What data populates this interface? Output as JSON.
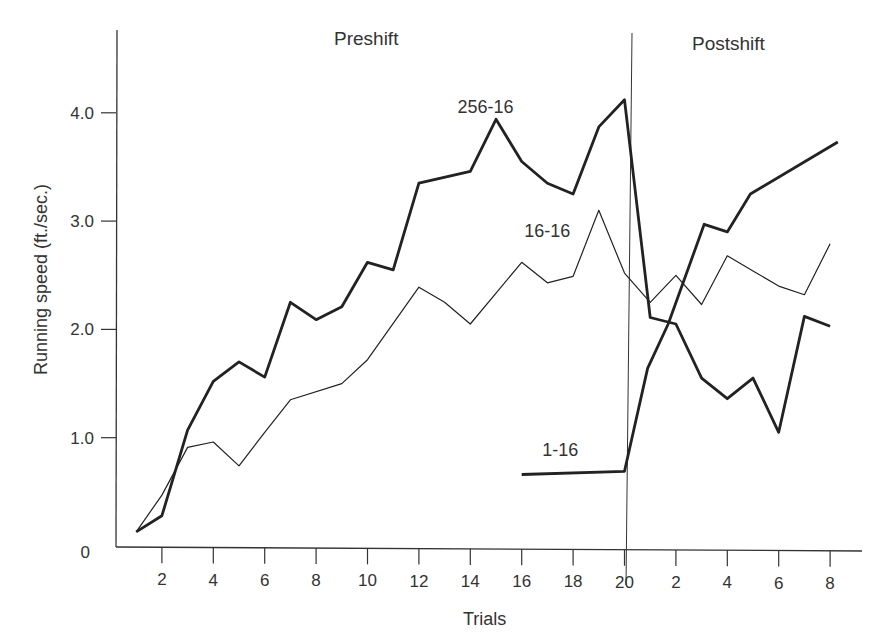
{
  "chart_data": {
    "type": "line",
    "title": "",
    "xlabel": "Trials",
    "ylabel": "Running speed (ft./sec.)",
    "ylim": [
      0,
      4.6
    ],
    "grid": false,
    "legend_position": "inline labels",
    "phase_labels": [
      "Preshift",
      "Postshift"
    ],
    "phase_boundary_after_trial": 20,
    "yticks": [
      {
        "value": 0,
        "label": "0"
      },
      {
        "value": 1.0,
        "label": "1.0"
      },
      {
        "value": 2.0,
        "label": "2.0"
      },
      {
        "value": 3.0,
        "label": "3.0"
      },
      {
        "value": 4.0,
        "label": "4.0"
      }
    ],
    "xticks": [
      {
        "pos": 2,
        "label": "2"
      },
      {
        "pos": 4,
        "label": "4"
      },
      {
        "pos": 6,
        "label": "6"
      },
      {
        "pos": 8,
        "label": "8"
      },
      {
        "pos": 10,
        "label": "10"
      },
      {
        "pos": 12,
        "label": "12"
      },
      {
        "pos": 14,
        "label": "14"
      },
      {
        "pos": 16,
        "label": "16"
      },
      {
        "pos": 18,
        "label": "18"
      },
      {
        "pos": 20,
        "label": "20"
      },
      {
        "pos": 22,
        "label": "2"
      },
      {
        "pos": 24,
        "label": "4"
      },
      {
        "pos": 26,
        "label": "6"
      },
      {
        "pos": 28,
        "label": "8"
      }
    ],
    "series": [
      {
        "name": "256-16",
        "weight": "thick",
        "x": [
          1,
          2,
          3,
          4,
          5,
          6,
          7,
          8,
          9,
          10,
          11,
          12,
          14,
          15,
          16,
          17,
          18,
          19,
          20,
          21,
          22,
          23,
          24,
          25,
          26,
          27,
          28
        ],
        "values": [
          0.13,
          0.28,
          1.07,
          1.52,
          1.7,
          1.56,
          2.25,
          2.09,
          2.21,
          2.62,
          2.55,
          3.35,
          3.46,
          3.94,
          3.55,
          3.35,
          3.25,
          3.87,
          4.12,
          2.11,
          2.05,
          1.55,
          1.36,
          1.55,
          1.05,
          2.12,
          2.03
        ]
      },
      {
        "name": "16-16",
        "weight": "thin",
        "x": [
          1,
          2,
          3,
          4,
          5,
          6,
          7,
          9,
          10,
          12,
          13,
          14,
          16,
          17,
          18,
          19,
          20,
          21,
          22,
          23,
          24,
          25,
          26,
          27,
          28
        ],
        "values": [
          0.13,
          0.47,
          0.91,
          0.96,
          0.74,
          1.05,
          1.35,
          1.5,
          1.72,
          2.39,
          2.25,
          2.05,
          2.62,
          2.43,
          2.49,
          3.1,
          2.52,
          2.25,
          2.5,
          2.23,
          2.68,
          2.54,
          2.4,
          2.32,
          2.79
        ]
      },
      {
        "name": "1-16",
        "weight": "thick",
        "x": [
          16,
          20,
          20.9,
          21.7,
          23.1,
          24.0,
          24.9,
          28.3
        ],
        "values": [
          0.66,
          0.69,
          1.64,
          2.05,
          2.97,
          2.9,
          3.25,
          3.73
        ]
      }
    ],
    "series_labels": [
      {
        "text": "256-16",
        "x": 13.5,
        "y": 4.0
      },
      {
        "text": "16-16",
        "x": 16.1,
        "y": 2.85
      },
      {
        "text": "1-16",
        "x": 16.8,
        "y": 0.83
      }
    ]
  }
}
